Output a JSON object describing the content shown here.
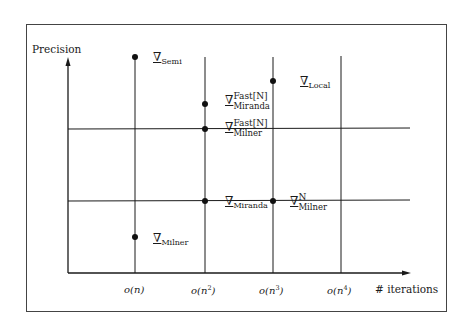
{
  "diagram": {
    "y_axis_label": "Precision",
    "x_axis_label": "# iterations",
    "x_ticks": [
      {
        "base": "o(n",
        "exp": "",
        "close": ")"
      },
      {
        "base": "o(n",
        "exp": "2",
        "close": ")"
      },
      {
        "base": "o(n",
        "exp": "3",
        "close": ")"
      },
      {
        "base": "o(n",
        "exp": "4",
        "close": ")"
      }
    ],
    "symbol": "∇",
    "points": [
      {
        "name": "Semi",
        "sup": "",
        "sub": "Semi",
        "x_tick": "o(n)",
        "level": "highest"
      },
      {
        "name": "Local",
        "sup": "",
        "sub": "Local",
        "x_tick": "o(n^3)",
        "level": "high"
      },
      {
        "name": "Fast[N] Miranda",
        "sup": "Fast[N]",
        "sub": "Miranda",
        "x_tick": "o(n^2)",
        "level": "high"
      },
      {
        "name": "Fast[N] Milner",
        "sup": "Fast[N]",
        "sub": "Milner",
        "x_tick": "o(n^2)",
        "level": "upper-mid"
      },
      {
        "name": "Miranda",
        "sup": "",
        "sub": "Miranda",
        "x_tick": "o(n^2)",
        "level": "lower-mid"
      },
      {
        "name": "N Milner",
        "sup": "N",
        "sub": "Milner",
        "x_tick": "o(n^3)",
        "level": "lower-mid"
      },
      {
        "name": "Milner",
        "sup": "",
        "sub": "Milner",
        "x_tick": "o(n)",
        "level": "low"
      }
    ]
  }
}
